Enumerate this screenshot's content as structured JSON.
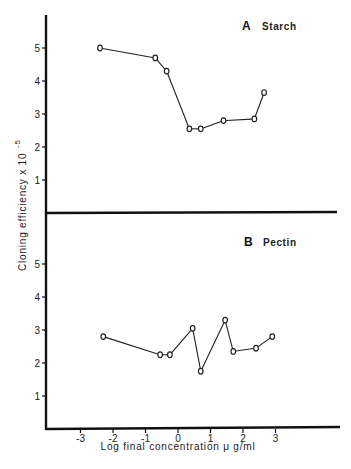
{
  "figure": {
    "ylabel": "Cloning efficiency  x 10",
    "ylabel_exponent": "-5",
    "xlabel": "Log  final concentration μ g/ml"
  },
  "chart_data": [
    {
      "type": "line",
      "panel": "A",
      "title": "Starch",
      "xlabel": "Log final concentration μg/ml",
      "ylabel": "Cloning efficiency x 10^-5",
      "x_ticks": [
        -3,
        -2,
        -1,
        0,
        1,
        2,
        3
      ],
      "y_ticks": [
        1,
        2,
        3,
        4,
        5
      ],
      "xlim": [
        -4,
        4
      ],
      "ylim": [
        0,
        6
      ],
      "grid": false,
      "marker": "open-circle",
      "series": [
        {
          "name": "Starch",
          "x": [
            -2.4,
            -0.7,
            -0.35,
            0.35,
            0.7,
            1.4,
            2.35,
            2.65
          ],
          "y": [
            5.0,
            4.7,
            4.3,
            2.55,
            2.55,
            2.8,
            2.85,
            3.65
          ]
        }
      ]
    },
    {
      "type": "line",
      "panel": "B",
      "title": "Pectin",
      "xlabel": "Log final concentration μg/ml",
      "ylabel": "Cloning efficiency x 10^-5",
      "x_ticks": [
        -3,
        -2,
        -1,
        0,
        1,
        2,
        3
      ],
      "y_ticks": [
        1,
        2,
        3,
        4,
        5
      ],
      "xlim": [
        -4,
        4
      ],
      "ylim": [
        0,
        6
      ],
      "grid": false,
      "marker": "open-circle",
      "series": [
        {
          "name": "Pectin",
          "x": [
            -2.3,
            -0.55,
            -0.25,
            0.45,
            0.7,
            1.45,
            1.7,
            2.4,
            2.9
          ],
          "y": [
            2.8,
            2.25,
            2.25,
            3.05,
            1.75,
            3.3,
            2.35,
            2.45,
            2.8
          ]
        }
      ]
    }
  ]
}
